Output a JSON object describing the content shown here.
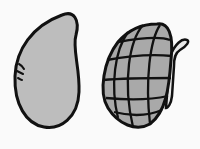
{
  "illustration": {
    "items": [
      {
        "name": "bean",
        "fill": "#bdbdbd",
        "stroke": "#111111"
      },
      {
        "name": "corn-cob",
        "fill": "#a9a9a9",
        "stroke": "#111111"
      }
    ],
    "background": "#fafafa"
  }
}
